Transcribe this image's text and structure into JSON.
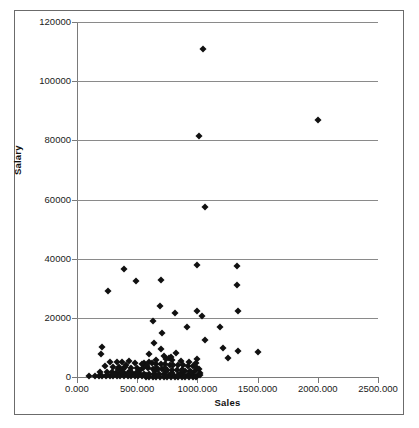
{
  "chart_data": {
    "type": "scatter",
    "title": "",
    "xlabel": "Sales",
    "ylabel": "Salary",
    "xlim": [
      0,
      2500
    ],
    "ylim": [
      0,
      120000
    ],
    "grid": true,
    "grid_axis": "y",
    "legend": "none",
    "marker": "diamond",
    "marker_color": "#111111",
    "xtick_labels": [
      "0.000",
      "500.000",
      "1000.000",
      "1500.000",
      "2000.000",
      "2500.000"
    ],
    "xtick_values": [
      0,
      500,
      1000,
      1500,
      2000,
      2500
    ],
    "ytick_labels": [
      "0",
      "20000",
      "40000",
      "60000",
      "80000",
      "100000",
      "120000"
    ],
    "ytick_values": [
      0,
      20000,
      40000,
      60000,
      80000,
      100000,
      120000
    ],
    "points": [
      [
        1050,
        111000
      ],
      [
        2000,
        87000
      ],
      [
        1010,
        81500
      ],
      [
        1060,
        57500
      ],
      [
        1000,
        38000
      ],
      [
        1330,
        37500
      ],
      [
        390,
        36500
      ],
      [
        1330,
        31000
      ],
      [
        490,
        32500
      ],
      [
        700,
        32800
      ],
      [
        260,
        29200
      ],
      [
        690,
        24000
      ],
      [
        1000,
        22200
      ],
      [
        1340,
        22300
      ],
      [
        810,
        21800
      ],
      [
        1040,
        20600
      ],
      [
        630,
        18900
      ],
      [
        1190,
        16800
      ],
      [
        910,
        17000
      ],
      [
        710,
        14800
      ],
      [
        1060,
        12600
      ],
      [
        640,
        11600
      ],
      [
        1210,
        9800
      ],
      [
        700,
        9300
      ],
      [
        210,
        10000
      ],
      [
        1340,
        8700
      ],
      [
        1500,
        8500
      ],
      [
        820,
        8000
      ],
      [
        200,
        7700
      ],
      [
        600,
        7900
      ],
      [
        1000,
        6200
      ],
      [
        1250,
        6500
      ],
      [
        760,
        6400
      ],
      [
        740,
        6100
      ],
      [
        790,
        5900
      ],
      [
        860,
        5500
      ],
      [
        930,
        5200
      ],
      [
        270,
        5100
      ],
      [
        330,
        5000
      ],
      [
        370,
        5200
      ],
      [
        430,
        5300
      ],
      [
        480,
        4900
      ],
      [
        560,
        4700
      ],
      [
        620,
        4600
      ],
      [
        660,
        4500
      ],
      [
        700,
        4400
      ],
      [
        730,
        4300
      ],
      [
        770,
        4200
      ],
      [
        800,
        4100
      ],
      [
        840,
        4000
      ],
      [
        880,
        3900
      ],
      [
        920,
        3800
      ],
      [
        960,
        3700
      ],
      [
        230,
        3600
      ],
      [
        300,
        3500
      ],
      [
        350,
        3400
      ],
      [
        400,
        3300
      ],
      [
        450,
        3200
      ],
      [
        500,
        3100
      ],
      [
        550,
        3000
      ],
      [
        590,
        2900
      ],
      [
        630,
        2800
      ],
      [
        670,
        2700
      ],
      [
        710,
        2600
      ],
      [
        750,
        2500
      ],
      [
        790,
        2400
      ],
      [
        830,
        2300
      ],
      [
        870,
        2200
      ],
      [
        900,
        2100
      ],
      [
        940,
        2000
      ],
      [
        980,
        1900
      ],
      [
        190,
        1800
      ],
      [
        250,
        1700
      ],
      [
        290,
        1600
      ],
      [
        320,
        1500
      ],
      [
        360,
        1400
      ],
      [
        390,
        1300
      ],
      [
        420,
        1250
      ],
      [
        460,
        1200
      ],
      [
        490,
        1150
      ],
      [
        520,
        1100
      ],
      [
        560,
        1050
      ],
      [
        600,
        1000
      ],
      [
        640,
        950
      ],
      [
        680,
        900
      ],
      [
        720,
        850
      ],
      [
        760,
        800
      ],
      [
        800,
        750
      ],
      [
        840,
        700
      ],
      [
        880,
        650
      ],
      [
        920,
        600
      ],
      [
        960,
        550
      ],
      [
        1000,
        500
      ],
      [
        1010,
        2600
      ],
      [
        1020,
        1400
      ],
      [
        150,
        400
      ],
      [
        180,
        350
      ],
      [
        210,
        300
      ],
      [
        240,
        280
      ],
      [
        270,
        260
      ],
      [
        300,
        250
      ],
      [
        330,
        240
      ],
      [
        360,
        230
      ],
      [
        390,
        220
      ],
      [
        420,
        210
      ],
      [
        450,
        200
      ],
      [
        480,
        190
      ],
      [
        510,
        180
      ],
      [
        540,
        170
      ],
      [
        570,
        160
      ],
      [
        600,
        150
      ],
      [
        630,
        140
      ],
      [
        660,
        130
      ],
      [
        690,
        120
      ],
      [
        720,
        110
      ],
      [
        750,
        100
      ],
      [
        780,
        95
      ],
      [
        810,
        90
      ],
      [
        840,
        85
      ],
      [
        870,
        80
      ],
      [
        900,
        75
      ],
      [
        930,
        70
      ],
      [
        960,
        65
      ],
      [
        990,
        60
      ],
      [
        100,
        300
      ],
      [
        340,
        2600
      ],
      [
        380,
        2700
      ],
      [
        410,
        4200
      ],
      [
        440,
        2000
      ],
      [
        520,
        2200
      ],
      [
        580,
        3600
      ],
      [
        660,
        3200
      ],
      [
        740,
        1900
      ],
      [
        860,
        1500
      ],
      [
        940,
        1100
      ],
      [
        1020,
        700
      ],
      [
        250,
        600
      ],
      [
        310,
        900
      ],
      [
        370,
        1700
      ],
      [
        430,
        900
      ],
      [
        500,
        1600
      ],
      [
        570,
        700
      ],
      [
        650,
        2100
      ],
      [
        730,
        3000
      ],
      [
        790,
        1300
      ],
      [
        870,
        2400
      ],
      [
        950,
        1800
      ],
      [
        780,
        6700
      ],
      [
        720,
        7000
      ],
      [
        660,
        5700
      ],
      [
        600,
        5000
      ],
      [
        540,
        4400
      ],
      [
        1000,
        3000
      ],
      [
        990,
        4600
      ]
    ]
  }
}
